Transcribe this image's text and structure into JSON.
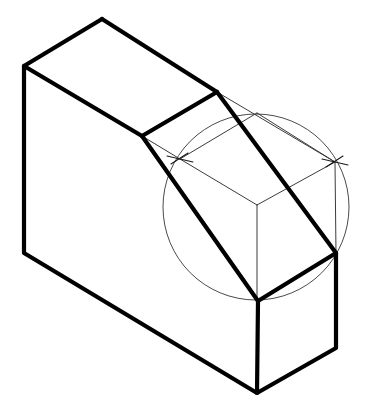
{
  "document": {
    "title": "Isometric Block with Angled Cut",
    "description": "Line drawing of a rectangular prism with a chamfered angular cut-away, overlaid with a light construction circle and two arc intersection tick marks.",
    "background_color": "#ffffff",
    "line_color": "#000000",
    "construction_color": "#4a4a4a",
    "canvas": {
      "width": 366,
      "height": 413
    }
  },
  "geometry": {
    "vertices": {
      "top_apex": {
        "x": 102,
        "y": 19,
        "label": "top-rear-apex"
      },
      "top_left": {
        "x": 24,
        "y": 66,
        "label": "top-left-corner"
      },
      "bottom_left": {
        "x": 24,
        "y": 253,
        "label": "bottom-left-corner"
      },
      "bottom_front": {
        "x": 257,
        "y": 393,
        "label": "bottom-front-corner"
      },
      "bottom_right": {
        "x": 336,
        "y": 348,
        "label": "bottom-right-corner"
      },
      "right_upper": {
        "x": 336,
        "y": 253,
        "label": "right-upper-corner"
      },
      "cut_notch": {
        "x": 142,
        "y": 136,
        "label": "notch-vertex"
      },
      "top_right_ridge": {
        "x": 217,
        "y": 92,
        "label": "ridge-right-end"
      },
      "front_low": {
        "x": 258,
        "y": 301,
        "label": "front-low-vertex"
      },
      "inner_center": {
        "x": 257,
        "y": 205,
        "label": "inner-face-junction"
      }
    },
    "construction_circle": {
      "center_x": 256,
      "center_y": 207,
      "radius": 93,
      "stroke_width": 1.0
    },
    "tick_marks": [
      {
        "x": 180,
        "y": 159,
        "label": "arc-intersection-left"
      },
      {
        "x": 335,
        "y": 162,
        "label": "arc-intersection-right"
      }
    ]
  },
  "paths": {
    "outline_main": "M 102 19 L 24 66 L 24 253 L 257 393 L 336 348 L 336 253",
    "top_face_edge": "M 102 19 L 217 92",
    "ridge_fold": "M 142 136 L 217 92",
    "notch_fold": "M 24 66 L 142 136",
    "cut_slope_left": "M 142 136 L 258 301",
    "cut_slope_right": "M 217 92 L 336 253",
    "front_base_left": "M 258 301 L 257 393",
    "front_base_right": "M 258 301 L 336 253",
    "construction_top_left": "M 142 136 L 180 159",
    "construction_ridge_right": "M 217 92 L 335 162",
    "construction_inner_left": "M 180 159 L 257 205",
    "construction_inner_right": "M 335 162 L 257 205",
    "construction_inner_drop": "M 257 205 L 257 301",
    "construction_right_vert": "M 335 162 L 336 253",
    "construction_upper_arc": "M 180 159 L 257 113 L 335 162"
  }
}
